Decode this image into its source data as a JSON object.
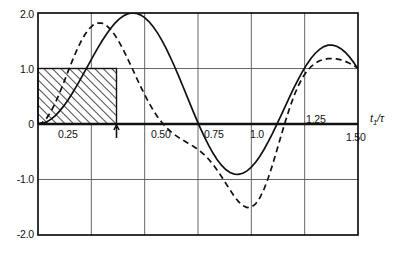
{
  "chart_data": {
    "type": "line",
    "title": "",
    "subtitle": "",
    "xlabel": "t1/tau",
    "xlabel_display": "t₁/τ",
    "ylabel": "",
    "xlim": [
      0.0,
      1.5
    ],
    "ylim": [
      -2.0,
      2.0
    ],
    "grid": true,
    "legend": "none",
    "x_ticks": [
      0.0,
      0.25,
      0.5,
      0.75,
      1.0,
      1.25,
      1.5
    ],
    "x_tick_labels": [
      "",
      "0.25",
      "0.50",
      "0.75",
      "1.0",
      "1.25",
      "1.50"
    ],
    "y_ticks": [
      -2.0,
      -1.0,
      0.0,
      1.0,
      2.0
    ],
    "y_tick_labels": [
      "-2.0",
      "-1.0",
      "0",
      "1.0",
      "2.0"
    ],
    "zero_line": 0.0,
    "annotations": [
      {
        "name": "hatched-region",
        "kind": "rect",
        "x0": 0.0,
        "x1": 0.368,
        "y0": 0.0,
        "y1": 1.0,
        "hatch": "diagonal-up-right",
        "label": ""
      },
      {
        "name": "axis-arrow-marker",
        "kind": "arrow-up",
        "x": 0.368,
        "y": 0.0,
        "label": ""
      }
    ],
    "series": [
      {
        "name": "solid-curve",
        "style": "solid",
        "color": "#111111",
        "x": [
          0.0,
          0.02,
          0.04,
          0.06,
          0.08,
          0.1,
          0.12,
          0.14,
          0.16,
          0.18,
          0.2,
          0.22,
          0.24,
          0.26,
          0.28,
          0.3,
          0.32,
          0.34,
          0.36,
          0.38,
          0.4,
          0.42,
          0.44,
          0.46,
          0.48,
          0.5,
          0.52,
          0.54,
          0.56,
          0.58,
          0.6,
          0.62,
          0.64,
          0.66,
          0.68,
          0.7,
          0.72,
          0.74,
          0.76,
          0.78,
          0.8,
          0.82,
          0.84,
          0.86,
          0.88,
          0.9,
          0.92,
          0.94,
          0.96,
          0.98,
          1.0,
          1.02,
          1.04,
          1.06,
          1.08,
          1.1,
          1.12,
          1.14,
          1.16,
          1.18,
          1.2,
          1.22,
          1.24,
          1.26,
          1.28,
          1.3,
          1.32,
          1.34,
          1.36,
          1.38,
          1.4,
          1.42,
          1.44,
          1.46,
          1.48,
          1.5
        ],
        "y": [
          0.0,
          0.02,
          0.078,
          0.174,
          0.306,
          0.472,
          0.669,
          0.894,
          1.142,
          1.409,
          1.69,
          1.979,
          2.271,
          2.561,
          2.843,
          3.11,
          3.357,
          3.58,
          3.772,
          3.93,
          4.049,
          4.127,
          4.161,
          4.149,
          4.092,
          3.988,
          3.84,
          3.648,
          3.416,
          3.146,
          2.843,
          2.511,
          2.155,
          1.782,
          1.396,
          1.005,
          0.614,
          0.231,
          -0.137,
          -0.484,
          -0.803,
          -1.09,
          -1.339,
          -1.545,
          -1.706,
          -1.818,
          -1.88,
          -1.89,
          -1.849,
          -1.757,
          -1.618,
          -1.433,
          -1.208,
          -0.946,
          -0.654,
          -0.339,
          -0.006,
          0.336,
          0.683,
          1.026,
          1.36,
          1.676,
          1.97,
          2.234,
          2.463,
          2.653,
          2.8,
          2.9,
          2.953,
          2.957,
          2.914,
          2.824,
          2.69,
          2.516,
          2.305,
          2.063
        ],
        "y_note": "rendered amplitude scaled so peak ≈ 2.0 on axis"
      },
      {
        "name": "dashed-curve",
        "style": "dashed",
        "color": "#111111",
        "x": [
          0.0,
          0.02,
          0.04,
          0.06,
          0.08,
          0.1,
          0.12,
          0.14,
          0.16,
          0.18,
          0.2,
          0.22,
          0.24,
          0.26,
          0.28,
          0.3,
          0.32,
          0.34,
          0.36,
          0.38,
          0.4,
          0.42,
          0.44,
          0.46,
          0.48,
          0.5,
          0.52,
          0.54,
          0.56,
          0.58,
          0.6,
          0.62,
          0.64,
          0.66,
          0.68,
          0.7,
          0.72,
          0.74,
          0.76,
          0.78,
          0.8,
          0.82,
          0.84,
          0.86,
          0.88,
          0.9,
          0.92,
          0.94,
          0.96,
          0.98,
          1.0,
          1.02,
          1.04,
          1.06,
          1.08,
          1.1,
          1.12,
          1.14,
          1.16,
          1.18,
          1.2,
          1.22,
          1.24,
          1.26,
          1.28,
          1.3,
          1.32,
          1.34,
          1.36,
          1.38,
          1.4,
          1.42,
          1.44,
          1.46,
          1.48,
          1.5
        ],
        "y": [
          0.0,
          0.055,
          0.209,
          0.449,
          0.76,
          1.122,
          1.516,
          1.922,
          2.32,
          2.693,
          3.025,
          3.303,
          3.517,
          3.66,
          3.728,
          3.721,
          3.641,
          3.494,
          3.288,
          3.032,
          2.737,
          2.415,
          2.078,
          1.736,
          1.401,
          1.081,
          0.783,
          0.512,
          0.271,
          0.062,
          -0.116,
          -0.267,
          -0.394,
          -0.502,
          -0.598,
          -0.689,
          -0.782,
          -0.884,
          -1.001,
          -1.139,
          -1.301,
          -1.489,
          -1.702,
          -1.936,
          -2.184,
          -2.432,
          -2.666,
          -2.866,
          -3.013,
          -3.086,
          -3.069,
          -2.949,
          -2.723,
          -2.395,
          -1.978,
          -1.492,
          -0.963,
          -0.419,
          0.11,
          0.602,
          1.039,
          1.41,
          1.712,
          1.947,
          2.122,
          2.247,
          2.332,
          2.385,
          2.412,
          2.417,
          2.402,
          2.367,
          2.314,
          2.244,
          2.157,
          2.056
        ],
        "y_note": "rendered amplitude scaled so peak ≈ 1.8 on axis"
      }
    ]
  },
  "axis": {
    "x_title": "t₁/τ",
    "x_title_base": "t",
    "x_title_sub": "1",
    "x_title_tail": "/τ"
  },
  "ticks": {
    "y": [
      {
        "label": "2.0",
        "value": 2.0
      },
      {
        "label": "1.0",
        "value": 1.0
      },
      {
        "label": "0",
        "value": 0.0
      },
      {
        "label": "-1.0",
        "value": -1.0
      },
      {
        "label": "-2.0",
        "value": -2.0
      }
    ],
    "x": [
      {
        "label": "0.25",
        "value": 0.25
      },
      {
        "label": "0.50",
        "value": 0.5
      },
      {
        "label": "0.75",
        "value": 0.75
      },
      {
        "label": "1.0",
        "value": 1.0
      },
      {
        "label": "1.25",
        "value": 1.25
      },
      {
        "label": "1.50",
        "value": 1.5
      }
    ]
  },
  "colors": {
    "frame": "#111111",
    "grid": "#555555",
    "curve": "#111111",
    "hatch": "#111111",
    "background": "#ffffff"
  }
}
